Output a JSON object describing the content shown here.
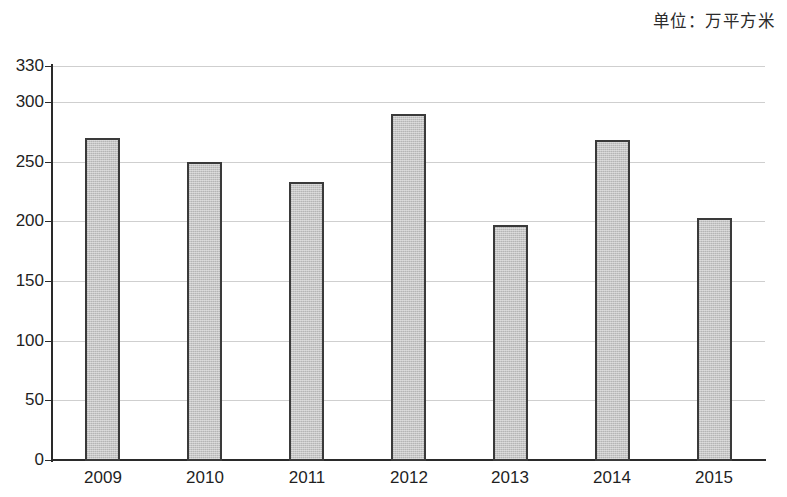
{
  "unit_caption": "单位：万平方米",
  "chart_data": {
    "type": "bar",
    "title": "",
    "subtitle": "",
    "xlabel": "",
    "ylabel": "",
    "unit_note": "单位：万平方米",
    "categories": [
      "2009",
      "2010",
      "2011",
      "2012",
      "2013",
      "2014",
      "2015"
    ],
    "values": [
      270,
      250,
      233,
      290,
      197,
      268,
      203
    ],
    "series": [
      {
        "name": "",
        "values": [
          270,
          250,
          233,
          290,
          197,
          268,
          203
        ]
      }
    ],
    "ylim": [
      0,
      330
    ],
    "yticks": [
      0,
      50,
      100,
      150,
      200,
      250,
      300,
      330
    ],
    "ytick_labels": [
      "0",
      "50",
      "100",
      "150",
      "200",
      "250",
      "300",
      "330"
    ],
    "grid": true,
    "grid_axis": "y",
    "legend": false,
    "legend_position": "none",
    "bar_fill_color": "#c6c6c6",
    "bar_edge_color": "#3a3a3a",
    "gridline_color": "#cfcfcf",
    "axis_color": "#2a2a2a",
    "background_color": "#ffffff"
  }
}
